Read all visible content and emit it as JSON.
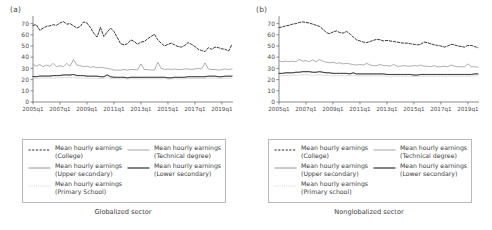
{
  "figure": {
    "panels": [
      {
        "id": "a",
        "label": "(a)",
        "caption": "Globalized sector",
        "legend": {
          "left": [
            {
              "key": "dashed-dark",
              "line1": "Mean hourly earnings",
              "line2": "(College)"
            },
            {
              "key": "solid-gray",
              "line1": "Mean hourly earnings",
              "line2": "(Upper secondary)"
            },
            {
              "key": "dotted-light",
              "line1": "Mean hourly earnings",
              "line2": "(Primary School)"
            }
          ],
          "right": [
            {
              "key": "solid-lightgray",
              "line1": "Mean hourly earnings",
              "line2": "(Technical degree)"
            },
            {
              "key": "solid-black",
              "line1": "Mean hourly earnings",
              "line2": "(Lower secondary)"
            }
          ]
        }
      },
      {
        "id": "b",
        "label": "(b)",
        "caption": "Nonglobalized sector",
        "legend": {
          "left": [
            {
              "key": "dashed-dark",
              "line1": "Mean hourly earnings",
              "line2": "(College)"
            },
            {
              "key": "solid-gray",
              "line1": "Mean hourly earnings",
              "line2": "(Upper secondary)"
            },
            {
              "key": "dotted-light",
              "line1": "Mean hourly earnings",
              "line2": "(Primary school)"
            }
          ],
          "right": [
            {
              "key": "solid-lightgray",
              "line1": "Mean hourly earnings",
              "line2": "(Technical degree)"
            },
            {
              "key": "solid-black",
              "line1": "Mean hourly earnings",
              "line2": "(Lower secondary)"
            }
          ]
        }
      }
    ],
    "colors": {
      "college": "#2b2b2b",
      "technical": "#9a9a9a",
      "upper_secondary": "#8a8a8a",
      "lower_secondary": "#222222",
      "primary": "#c9c9c9",
      "axis": "#5a5a5a",
      "legend_border": "#b9b9b9"
    }
  },
  "chart_data": [
    {
      "type": "line",
      "title": "(a) Globalized sector",
      "xlabel": "",
      "ylabel": "",
      "ylim": [
        0,
        75
      ],
      "yticks": [
        0,
        10,
        20,
        30,
        40,
        50,
        60,
        70
      ],
      "xticks": [
        "2005q1",
        "2007q1",
        "2009q1",
        "2011q1",
        "2013q1",
        "2015q1",
        "2017q1",
        "2019q1"
      ],
      "xtick_positions": [
        0,
        8,
        16,
        24,
        32,
        40,
        48,
        56
      ],
      "x": [
        "2005q1",
        "2005q2",
        "2005q3",
        "2005q4",
        "2006q1",
        "2006q2",
        "2006q3",
        "2006q4",
        "2007q1",
        "2007q2",
        "2007q3",
        "2007q4",
        "2008q1",
        "2008q2",
        "2008q3",
        "2008q4",
        "2009q1",
        "2009q2",
        "2009q3",
        "2009q4",
        "2010q1",
        "2010q2",
        "2010q3",
        "2010q4",
        "2011q1",
        "2011q2",
        "2011q3",
        "2011q4",
        "2012q1",
        "2012q2",
        "2012q3",
        "2012q4",
        "2013q1",
        "2013q2",
        "2013q3",
        "2013q4",
        "2014q1",
        "2014q2",
        "2014q3",
        "2014q4",
        "2015q1",
        "2015q2",
        "2015q3",
        "2015q4",
        "2016q1",
        "2016q2",
        "2016q3",
        "2016q4",
        "2017q1",
        "2017q2",
        "2017q3",
        "2017q4",
        "2018q1",
        "2018q2",
        "2018q3",
        "2018q4",
        "2019q1",
        "2019q2",
        "2019q3",
        "2019q4"
      ],
      "grid": false,
      "legend_position": "below",
      "series": [
        {
          "name": "Mean hourly earnings (College)",
          "style": "dashed",
          "color": "#2b2b2b",
          "values": [
            68.5,
            69.0,
            64.0,
            66.0,
            67.5,
            68.0,
            69.0,
            68.5,
            70.5,
            71.8,
            69.5,
            70.0,
            68.0,
            66.0,
            67.5,
            71.5,
            70.5,
            66.5,
            61.5,
            58.0,
            66.5,
            58.5,
            62.5,
            66.0,
            63.0,
            57.5,
            52.0,
            51.0,
            52.0,
            55.5,
            54.0,
            51.5,
            53.5,
            54.0,
            56.5,
            58.5,
            60.5,
            55.5,
            52.5,
            50.0,
            51.5,
            52.5,
            51.0,
            49.5,
            49.0,
            50.5,
            53.0,
            51.5,
            49.5,
            47.0,
            46.0,
            45.0,
            48.5,
            47.0,
            49.0,
            48.5,
            47.5,
            47.0,
            45.5,
            51.5
          ]
        },
        {
          "name": "Mean hourly earnings (Technical degree)",
          "style": "solid",
          "color": "#9a9a9a",
          "values": [
            33.5,
            32.0,
            33.5,
            31.5,
            33.0,
            32.0,
            34.5,
            31.5,
            32.5,
            31.5,
            34.5,
            32.0,
            38.0,
            33.0,
            32.5,
            31.5,
            32.0,
            31.0,
            31.5,
            30.5,
            31.0,
            30.5,
            30.0,
            29.5,
            28.5,
            28.5,
            28.5,
            29.0,
            28.5,
            29.0,
            29.0,
            28.5,
            34.0,
            29.0,
            29.0,
            28.5,
            28.5,
            35.5,
            30.0,
            29.0,
            29.5,
            29.0,
            29.5,
            29.0,
            29.0,
            29.5,
            29.5,
            29.0,
            29.5,
            30.0,
            29.5,
            35.0,
            29.5,
            29.0,
            29.0,
            28.5,
            29.0,
            29.5,
            29.0,
            29.5
          ]
        },
        {
          "name": "Mean hourly earnings (Upper secondary)",
          "style": "solid",
          "color": "#8a8a8a",
          "values": [
            22.5,
            22.5,
            23.0,
            23.0,
            23.0,
            23.0,
            23.5,
            23.5,
            23.5,
            24.0,
            24.0,
            24.0,
            24.5,
            23.5,
            23.5,
            23.5,
            23.0,
            23.0,
            23.0,
            23.0,
            22.5,
            22.5,
            24.0,
            22.5,
            22.0,
            22.0,
            22.0,
            22.0,
            21.5,
            22.0,
            22.0,
            22.0,
            22.0,
            22.0,
            22.0,
            22.0,
            22.0,
            22.0,
            22.0,
            22.0,
            21.5,
            21.5,
            22.0,
            22.0,
            22.0,
            22.0,
            22.5,
            22.5,
            22.5,
            22.5,
            22.5,
            22.5,
            23.0,
            23.0,
            23.0,
            22.5,
            22.5,
            23.0,
            23.0,
            23.0
          ]
        },
        {
          "name": "Mean hourly earnings (Lower secondary)",
          "style": "solid",
          "color": "#222222",
          "values": [
            22.8,
            22.6,
            23.2,
            23.2,
            23.2,
            23.2,
            23.6,
            23.6,
            23.7,
            24.2,
            24.2,
            24.1,
            24.6,
            23.7,
            23.6,
            23.6,
            23.1,
            23.1,
            23.1,
            23.1,
            22.6,
            22.6,
            24.2,
            22.6,
            22.1,
            22.1,
            22.1,
            22.1,
            21.6,
            22.1,
            22.1,
            22.1,
            22.1,
            22.1,
            22.1,
            22.1,
            22.1,
            22.1,
            22.1,
            22.1,
            21.6,
            21.6,
            22.1,
            22.1,
            22.1,
            22.1,
            22.6,
            22.6,
            22.6,
            22.6,
            22.6,
            22.6,
            23.1,
            23.1,
            23.1,
            22.6,
            22.6,
            23.1,
            23.1,
            23.1
          ]
        },
        {
          "name": "Mean hourly earnings (Primary School)",
          "style": "dotted",
          "color": "#c9c9c9",
          "values": [
            21.0,
            21.0,
            21.2,
            21.3,
            21.3,
            21.3,
            21.5,
            21.5,
            21.6,
            21.8,
            21.8,
            21.8,
            22.0,
            21.5,
            21.5,
            21.5,
            21.2,
            21.2,
            21.2,
            21.2,
            21.0,
            21.0,
            21.8,
            21.0,
            20.8,
            20.8,
            20.8,
            20.8,
            20.5,
            20.8,
            20.8,
            20.8,
            20.8,
            20.8,
            20.8,
            20.8,
            20.8,
            20.8,
            20.8,
            20.8,
            20.5,
            20.5,
            20.8,
            20.8,
            20.8,
            20.8,
            21.0,
            21.0,
            21.0,
            21.0,
            21.0,
            21.0,
            21.3,
            21.3,
            21.3,
            21.0,
            21.0,
            21.3,
            21.3,
            21.3
          ]
        }
      ]
    },
    {
      "type": "line",
      "title": "(b) Nonglobalized sector",
      "xlabel": "",
      "ylabel": "",
      "ylim": [
        0,
        75
      ],
      "yticks": [
        0,
        10,
        20,
        30,
        40,
        50,
        60,
        70
      ],
      "xticks": [
        "2005q1",
        "2007q1",
        "2009q1",
        "2011q1",
        "2013q1",
        "2015q1",
        "2017q1",
        "2019q1"
      ],
      "xtick_positions": [
        0,
        8,
        16,
        24,
        32,
        40,
        48,
        56
      ],
      "x": [
        "2005q1",
        "2005q2",
        "2005q3",
        "2005q4",
        "2006q1",
        "2006q2",
        "2006q3",
        "2006q4",
        "2007q1",
        "2007q2",
        "2007q3",
        "2007q4",
        "2008q1",
        "2008q2",
        "2008q3",
        "2008q4",
        "2009q1",
        "2009q2",
        "2009q3",
        "2009q4",
        "2010q1",
        "2010q2",
        "2010q3",
        "2010q4",
        "2011q1",
        "2011q2",
        "2011q3",
        "2011q4",
        "2012q1",
        "2012q2",
        "2012q3",
        "2012q4",
        "2013q1",
        "2013q2",
        "2013q3",
        "2013q4",
        "2014q1",
        "2014q2",
        "2014q3",
        "2014q4",
        "2015q1",
        "2015q2",
        "2015q3",
        "2015q4",
        "2016q1",
        "2016q2",
        "2016q3",
        "2016q4",
        "2017q1",
        "2017q2",
        "2017q3",
        "2017q4",
        "2018q1",
        "2018q2",
        "2018q3",
        "2018q4",
        "2019q1",
        "2019q2",
        "2019q3",
        "2019q4"
      ],
      "grid": false,
      "legend_position": "below",
      "series": [
        {
          "name": "Mean hourly earnings (College)",
          "style": "dashed",
          "color": "#2b2b2b",
          "values": [
            66.5,
            67.0,
            68.0,
            68.5,
            69.5,
            70.0,
            71.0,
            71.5,
            71.0,
            70.5,
            69.5,
            68.5,
            67.5,
            65.0,
            62.0,
            61.0,
            62.5,
            63.5,
            62.0,
            61.5,
            63.0,
            61.0,
            58.0,
            55.5,
            54.5,
            53.5,
            53.0,
            54.0,
            55.0,
            56.0,
            55.5,
            54.5,
            55.0,
            54.5,
            54.0,
            53.5,
            53.0,
            52.5,
            52.5,
            52.0,
            51.5,
            51.0,
            51.5,
            53.5,
            53.0,
            52.0,
            51.0,
            50.5,
            50.0,
            49.0,
            50.0,
            51.5,
            51.0,
            50.0,
            49.5,
            49.0,
            50.5,
            50.5,
            49.5,
            48.5
          ]
        },
        {
          "name": "Mean hourly earnings (Technical degree)",
          "style": "solid",
          "color": "#9a9a9a",
          "values": [
            36.5,
            36.0,
            36.5,
            36.0,
            36.5,
            36.0,
            38.0,
            36.5,
            37.0,
            36.0,
            37.5,
            36.0,
            38.0,
            36.5,
            35.5,
            35.0,
            35.5,
            34.5,
            35.0,
            34.0,
            34.5,
            34.0,
            33.5,
            33.0,
            33.5,
            33.0,
            34.5,
            33.0,
            32.5,
            32.5,
            33.5,
            32.5,
            32.5,
            32.0,
            33.5,
            32.0,
            32.0,
            32.5,
            32.0,
            32.0,
            32.5,
            32.0,
            33.0,
            32.0,
            32.0,
            31.5,
            32.5,
            31.5,
            31.5,
            32.0,
            31.5,
            33.0,
            32.0,
            31.5,
            31.5,
            31.5,
            34.0,
            31.5,
            31.5,
            31.0
          ]
        },
        {
          "name": "Mean hourly earnings (Upper secondary)",
          "style": "solid",
          "color": "#8a8a8a",
          "values": [
            25.5,
            25.5,
            26.0,
            26.0,
            26.0,
            26.5,
            26.5,
            27.0,
            27.0,
            27.0,
            26.5,
            26.5,
            27.0,
            26.5,
            26.0,
            26.0,
            25.5,
            25.5,
            25.5,
            25.5,
            25.5,
            25.0,
            26.0,
            25.0,
            25.0,
            25.0,
            25.0,
            25.0,
            25.0,
            25.0,
            25.0,
            25.0,
            24.5,
            24.5,
            24.5,
            24.5,
            24.5,
            24.5,
            24.5,
            24.5,
            24.0,
            24.0,
            24.5,
            24.5,
            24.5,
            24.5,
            24.5,
            24.5,
            24.5,
            24.5,
            24.5,
            24.5,
            24.5,
            24.5,
            24.5,
            24.5,
            24.5,
            24.5,
            25.0,
            25.0
          ]
        },
        {
          "name": "Mean hourly earnings (Lower secondary)",
          "style": "solid",
          "color": "#222222",
          "values": [
            25.6,
            25.6,
            26.1,
            26.1,
            26.1,
            26.6,
            26.6,
            27.1,
            27.1,
            27.1,
            26.6,
            26.6,
            27.1,
            26.6,
            26.1,
            26.1,
            25.6,
            25.6,
            25.6,
            25.6,
            25.6,
            25.1,
            26.1,
            25.1,
            25.1,
            25.1,
            25.1,
            25.1,
            25.1,
            25.1,
            25.1,
            25.1,
            24.6,
            24.6,
            24.6,
            24.6,
            24.6,
            24.6,
            24.6,
            24.6,
            24.1,
            24.1,
            24.6,
            24.6,
            24.6,
            24.6,
            24.6,
            24.6,
            24.6,
            24.6,
            24.6,
            24.6,
            24.6,
            24.6,
            24.6,
            24.6,
            24.6,
            24.6,
            25.1,
            25.1
          ]
        },
        {
          "name": "Mean hourly earnings (Primary school)",
          "style": "dotted",
          "color": "#c9c9c9",
          "values": [
            23.5,
            23.5,
            23.8,
            23.8,
            23.8,
            24.0,
            24.0,
            24.3,
            24.3,
            24.3,
            24.0,
            24.0,
            24.3,
            24.0,
            23.8,
            23.8,
            23.5,
            23.5,
            23.5,
            23.5,
            23.5,
            23.3,
            23.8,
            23.3,
            23.3,
            23.3,
            23.3,
            23.3,
            23.3,
            23.3,
            23.3,
            23.3,
            23.0,
            23.0,
            23.0,
            23.0,
            23.0,
            23.0,
            23.0,
            23.0,
            22.8,
            22.8,
            23.0,
            23.0,
            23.0,
            23.0,
            23.0,
            23.0,
            23.0,
            23.0,
            23.0,
            23.0,
            23.0,
            23.0,
            23.0,
            23.0,
            23.0,
            23.0,
            23.3,
            23.3
          ]
        }
      ]
    }
  ]
}
